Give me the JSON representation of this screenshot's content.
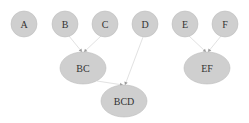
{
  "diagram": {
    "type": "tree",
    "background": "#ffffff",
    "node_fill": "#cfcfcf",
    "edge_color": "#e2e2e2",
    "label_color": "#333333",
    "nodes": [
      {
        "id": "A",
        "label": "A",
        "shape": "circle",
        "cx": 24,
        "cy": 24,
        "rx": 13,
        "ry": 13
      },
      {
        "id": "B",
        "label": "B",
        "shape": "circle",
        "cx": 65,
        "cy": 24,
        "rx": 13,
        "ry": 13
      },
      {
        "id": "C",
        "label": "C",
        "shape": "circle",
        "cx": 105,
        "cy": 24,
        "rx": 13,
        "ry": 13
      },
      {
        "id": "D",
        "label": "D",
        "shape": "circle",
        "cx": 145,
        "cy": 24,
        "rx": 13,
        "ry": 13
      },
      {
        "id": "E",
        "label": "E",
        "shape": "circle",
        "cx": 185,
        "cy": 24,
        "rx": 13,
        "ry": 13
      },
      {
        "id": "F",
        "label": "F",
        "shape": "circle",
        "cx": 225,
        "cy": 24,
        "rx": 13,
        "ry": 13
      },
      {
        "id": "BC",
        "label": "BC",
        "shape": "ellipse",
        "cx": 83,
        "cy": 68,
        "rx": 23,
        "ry": 16
      },
      {
        "id": "BCD",
        "label": "BCD",
        "shape": "ellipse",
        "cx": 124,
        "cy": 101,
        "rx": 23,
        "ry": 16
      },
      {
        "id": "EF",
        "label": "EF",
        "shape": "ellipse",
        "cx": 207,
        "cy": 68,
        "rx": 23,
        "ry": 16
      }
    ],
    "edges": [
      {
        "from": "B",
        "to": "BC",
        "x1": 69,
        "y1": 36,
        "x2": 82,
        "y2": 52
      },
      {
        "from": "C",
        "to": "BC",
        "x1": 101,
        "y1": 36,
        "x2": 84,
        "y2": 52
      },
      {
        "from": "BC",
        "to": "BCD",
        "x1": 97,
        "y1": 81,
        "x2": 123,
        "y2": 85
      },
      {
        "from": "D",
        "to": "BCD",
        "x1": 143,
        "y1": 37,
        "x2": 125,
        "y2": 85
      },
      {
        "from": "E",
        "to": "EF",
        "x1": 189,
        "y1": 36,
        "x2": 206,
        "y2": 52
      },
      {
        "from": "F",
        "to": "EF",
        "x1": 221,
        "y1": 36,
        "x2": 208,
        "y2": 52
      }
    ]
  }
}
